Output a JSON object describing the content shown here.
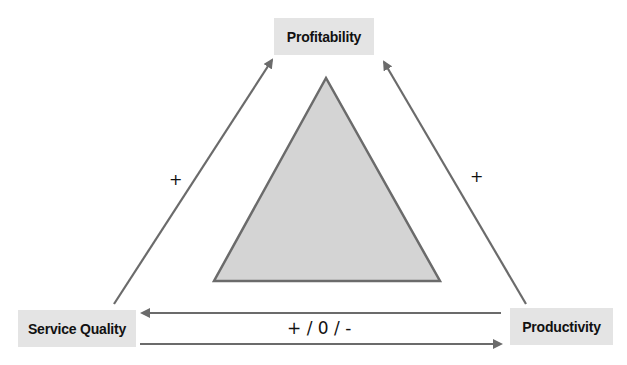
{
  "nodes": {
    "profitability": "Profitability",
    "service_quality": "Service Quality",
    "productivity": "Productivity"
  },
  "edges": {
    "service_quality_to_profitability": {
      "sign": "+"
    },
    "productivity_to_profitability": {
      "sign": "+"
    },
    "service_quality_productivity": {
      "sign": "+ / 0 / -"
    }
  },
  "colors": {
    "node_fill": "#e4e4e4",
    "arrow": "#6b6b6b",
    "triangle_fill": "#d4d4d4",
    "triangle_stroke": "#6b6b6b"
  }
}
